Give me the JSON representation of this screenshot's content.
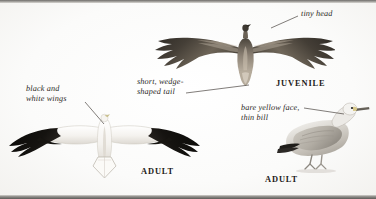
{
  "plate": {
    "width": 376,
    "height": 199,
    "background": "#fdfdfc",
    "ink": "#2a2724"
  },
  "annotations": [
    {
      "id": "tiny-head",
      "name": "annotation-tiny-head",
      "text": "tiny head",
      "x": 301,
      "y": 9,
      "align": "left",
      "leader": {
        "x1": 298,
        "y1": 16,
        "x2": 271,
        "y2": 28
      }
    },
    {
      "id": "black-and-white-wings",
      "name": "annotation-black-and-white-wings",
      "text": "black and\nwhite wings",
      "x": 26,
      "y": 84,
      "align": "left",
      "leader": {
        "x1": 85,
        "y1": 102,
        "x2": 104,
        "y2": 124
      }
    },
    {
      "id": "short-wedge-shaped-tail",
      "name": "annotation-short-wedge-shaped-tail",
      "text": "short, wedge-\nshaped tail",
      "x": 137,
      "y": 77,
      "align": "left",
      "leader": {
        "x1": 186,
        "y1": 93,
        "x2": 249,
        "y2": 85
      }
    },
    {
      "id": "bare-yellow-face-thin-bill",
      "name": "annotation-bare-yellow-face-thin-bill",
      "text": "bare yellow face,\nthin bill",
      "x": 241,
      "y": 103,
      "align": "left",
      "leader": {
        "x1": 304,
        "y1": 108,
        "x2": 344,
        "y2": 114
      }
    }
  ],
  "captions": [
    {
      "id": "juvenile",
      "name": "caption-juvenile",
      "text": "JUVENILE",
      "x": 276,
      "y": 79
    },
    {
      "id": "adult-flight",
      "name": "caption-adult-flight",
      "text": "ADULT",
      "x": 141,
      "y": 167
    },
    {
      "id": "adult-perched",
      "name": "caption-adult-perched",
      "text": "ADULT",
      "x": 265,
      "y": 175
    }
  ],
  "figures": [
    {
      "id": "juvenile-in-flight",
      "name": "figure-juvenile-in-flight",
      "description": "juvenile eagle soaring, dorsal view, dark mottled brown wings with fingered primaries",
      "x": 150,
      "y": 16,
      "width": 185,
      "height": 72,
      "plumage": "#3a3530",
      "accent": "#8d8377"
    },
    {
      "id": "adult-in-flight",
      "name": "figure-adult-in-flight",
      "description": "adult soaring, dorsal view, black outer wings and white inner wings and body, short wedge-shaped white tail",
      "x": 6,
      "y": 104,
      "width": 196,
      "height": 76,
      "plumage": "#17140f",
      "accent": "#e9e6e0"
    },
    {
      "id": "adult-perched",
      "name": "figure-adult-perched",
      "description": "adult standing in profile facing right, pale grey body, thin bill, black wingtips",
      "x": 276,
      "y": 96,
      "width": 96,
      "height": 80,
      "plumage": "#b9b5ae",
      "accent": "#21201d"
    }
  ]
}
